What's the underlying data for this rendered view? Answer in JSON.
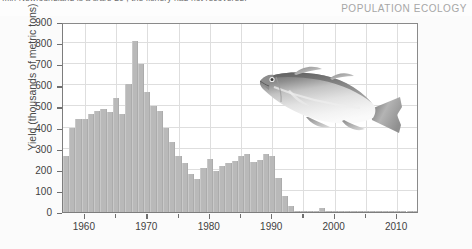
{
  "header": {
    "cropped_caption": "...in Newfoundland is a s/a/e 20  , the fishery had not recovered.",
    "section_label": "POPULATION ECOLOGY"
  },
  "icons": {
    "fish": "cod-fish-illustration"
  },
  "colors": {
    "bar_fill": "#b9b9b9",
    "gridline": "#dedede",
    "axis": "#7d7d7d",
    "tick_label": "#3f3f3f",
    "axis_title": "#4a4a4a",
    "section_label": "#a6a6a6",
    "figure_background": "#fbfbfb",
    "plot_background": "#ffffff"
  },
  "chart_data": {
    "type": "bar",
    "title": "",
    "xlabel": "",
    "ylabel": "Yield (thousands of metric tons)",
    "xlim": [
      1956.5,
      2013.5
    ],
    "ylim": [
      0,
      900
    ],
    "grid": true,
    "legend": "none",
    "ytick_labels": [
      "0",
      "100",
      "200",
      "300",
      "400",
      "500",
      "600",
      "700",
      "800",
      "900"
    ],
    "ytick_values": [
      0,
      100,
      200,
      300,
      400,
      500,
      600,
      700,
      800,
      900
    ],
    "xtick_labels": [
      "1960",
      "1970",
      "1980",
      "1990",
      "2000",
      "2010"
    ],
    "xtick_values": [
      1960,
      1970,
      1980,
      1990,
      2000,
      2010
    ],
    "xtick_minor_values": [
      1965,
      1975,
      1985,
      1995,
      2005
    ],
    "categories": [
      1957,
      1958,
      1959,
      1960,
      1961,
      1962,
      1963,
      1964,
      1965,
      1966,
      1967,
      1968,
      1969,
      1970,
      1971,
      1972,
      1973,
      1974,
      1975,
      1976,
      1977,
      1978,
      1979,
      1980,
      1981,
      1982,
      1983,
      1984,
      1985,
      1986,
      1987,
      1988,
      1989,
      1990,
      1991,
      1992,
      1993,
      1994,
      1995,
      1996,
      1997,
      1998,
      1999,
      2000,
      2001,
      2002,
      2003,
      2004,
      2005,
      2006,
      2007,
      2008,
      2009,
      2010,
      2011,
      2012,
      2013
    ],
    "values": [
      265,
      400,
      440,
      440,
      465,
      480,
      490,
      475,
      540,
      465,
      605,
      810,
      700,
      570,
      500,
      480,
      400,
      330,
      265,
      230,
      180,
      155,
      210,
      250,
      195,
      220,
      230,
      240,
      265,
      275,
      235,
      245,
      275,
      265,
      160,
      75,
      30,
      5,
      3,
      2,
      2,
      20,
      2,
      2,
      1,
      1,
      1,
      1,
      1,
      1,
      1,
      1,
      1,
      1,
      1,
      1,
      1
    ],
    "annotations": [
      {
        "type": "image",
        "name": "cod-fish-illustration",
        "x_range": [
          1977,
          1999
        ],
        "y_range": [
          560,
          870
        ]
      }
    ]
  }
}
